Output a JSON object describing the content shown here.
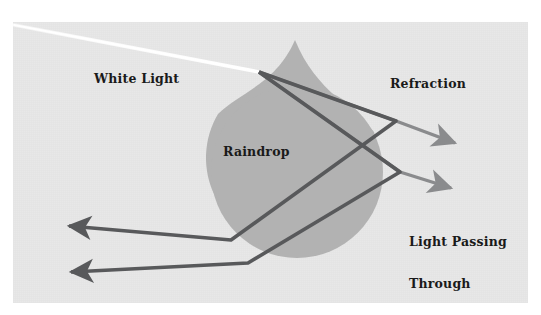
{
  "figure": {
    "canvas": {
      "width": 541,
      "height": 315
    },
    "panel": {
      "background_color": "#e8e8e8",
      "x": 13,
      "y": 22,
      "width": 515,
      "height": 281
    }
  },
  "labels": {
    "white_light": "White Light",
    "raindrop": "Raindrop",
    "refraction": "Refraction",
    "light_passing_through_line1": "Light Passing",
    "light_passing_through_line2": "Through"
  },
  "colors": {
    "panel_background": "#e8e8e8",
    "raindrop_fill": "#b2b2b2",
    "incoming_beam": "#ffffff",
    "ray_dark": "#58595b",
    "ray_mid": "#6d6e71",
    "ray_light": "#8a8b8d",
    "text": "#1a1a1a"
  },
  "elements": {
    "raindrop": {
      "name": "raindrop",
      "shape": "teardrop",
      "apex": {
        "x": 295,
        "y": 40
      },
      "circle_center": {
        "x": 297,
        "y": 172
      },
      "circle_radius": 86,
      "fill": "#b2b2b2"
    },
    "incoming_white_light": {
      "name": "white-light-beam",
      "from": {
        "x": 14,
        "y": 25
      },
      "to": {
        "x": 258,
        "y": 72
      },
      "color": "#ffffff",
      "width": 3
    },
    "rays": [
      {
        "name": "ray-refracted-upper",
        "points": "258,72 396,121 462,145",
        "has_arrow": true,
        "arrow_at": {
          "x": 462,
          "y": 145
        },
        "color": "#8a8b8d"
      },
      {
        "name": "ray-refracted-lower",
        "points": "258,72 400,172 458,190",
        "has_arrow": true,
        "arrow_at": {
          "x": 458,
          "y": 190
        },
        "color": "#8a8b8d"
      },
      {
        "name": "ray-internal-reflected-upper",
        "points": "396,121 231,240 60,225",
        "has_arrow": true,
        "arrow_at": {
          "x": 60,
          "y": 225
        },
        "color": "#58595b"
      },
      {
        "name": "ray-internal-reflected-lower",
        "points": "400,172 248,263 62,272",
        "has_arrow": true,
        "arrow_at": {
          "x": 62,
          "y": 272
        },
        "color": "#58595b"
      }
    ]
  },
  "annotations": [
    {
      "name": "label-white-light",
      "text": "White Light",
      "x": 94,
      "y": 72
    },
    {
      "name": "label-raindrop",
      "text": "Raindrop",
      "x": 223,
      "y": 145
    },
    {
      "name": "label-refraction",
      "text": "Refraction",
      "x": 390,
      "y": 77
    },
    {
      "name": "label-light-passing-through",
      "text": "Light Passing Through",
      "x": 409,
      "y": 207
    }
  ]
}
